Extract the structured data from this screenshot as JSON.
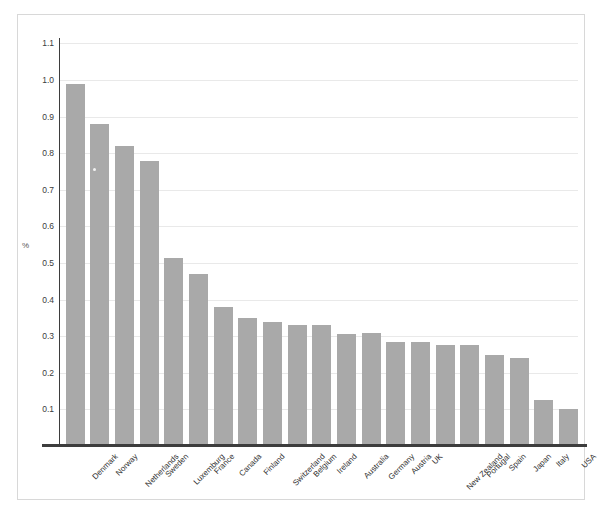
{
  "chart_data": {
    "type": "bar",
    "title": "",
    "subtitle": "",
    "xlabel": "",
    "ylabel": "%",
    "ylim": [
      0,
      1.15
    ],
    "yticks": [
      "0.1",
      "0.2",
      "0.3",
      "0.4",
      "0.5",
      "0.6",
      "0.7",
      "0.8",
      "0.9",
      "1.0",
      "1.1"
    ],
    "ytick_values": [
      0.1,
      0.2,
      0.3,
      0.4,
      0.5,
      0.6,
      0.7,
      0.8,
      0.9,
      1.0,
      1.1
    ],
    "grid": "horizontal",
    "legend": "none",
    "bar_color": "#a9a9a9",
    "categories": [
      "Denmark",
      "Norway",
      "Netherlands",
      "Sweden",
      "Luxemburg",
      "France",
      "Canada",
      "Finland",
      "Switzerland",
      "Belgium",
      "Ireland",
      "Australia",
      "Germany",
      "Austria",
      "UK",
      "New Zealand",
      "Portugal",
      "Spain",
      "Japan",
      "Italy",
      "USA"
    ],
    "values": [
      0.99,
      0.88,
      0.82,
      0.78,
      0.515,
      0.47,
      0.38,
      0.35,
      0.34,
      0.33,
      0.33,
      0.305,
      0.31,
      0.285,
      0.285,
      0.275,
      0.275,
      0.25,
      0.24,
      0.125,
      0.1
    ]
  }
}
